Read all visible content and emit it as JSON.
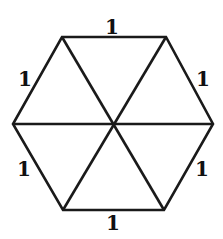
{
  "diagram": {
    "type": "regular-hexagon-triangulated",
    "stroke_color": "#1a1a1a",
    "vertices": [
      {
        "name": "top-left",
        "x": 62,
        "y": 37
      },
      {
        "name": "top-right",
        "x": 166,
        "y": 37
      },
      {
        "name": "right",
        "x": 213,
        "y": 124
      },
      {
        "name": "bottom-right",
        "x": 164,
        "y": 210
      },
      {
        "name": "bottom-left",
        "x": 63,
        "y": 210
      },
      {
        "name": "left",
        "x": 13,
        "y": 124
      }
    ],
    "center": {
      "x": 114,
      "y": 124
    },
    "edge_labels": [
      {
        "edge": "top",
        "text": "1",
        "x": 112,
        "y": 27
      },
      {
        "edge": "upper-right",
        "text": "1",
        "x": 203,
        "y": 79
      },
      {
        "edge": "lower-right",
        "text": "1",
        "x": 202,
        "y": 169
      },
      {
        "edge": "bottom",
        "text": "1",
        "x": 113,
        "y": 223
      },
      {
        "edge": "lower-left",
        "text": "1",
        "x": 24,
        "y": 169
      },
      {
        "edge": "upper-left",
        "text": "1",
        "x": 25,
        "y": 79
      }
    ]
  }
}
